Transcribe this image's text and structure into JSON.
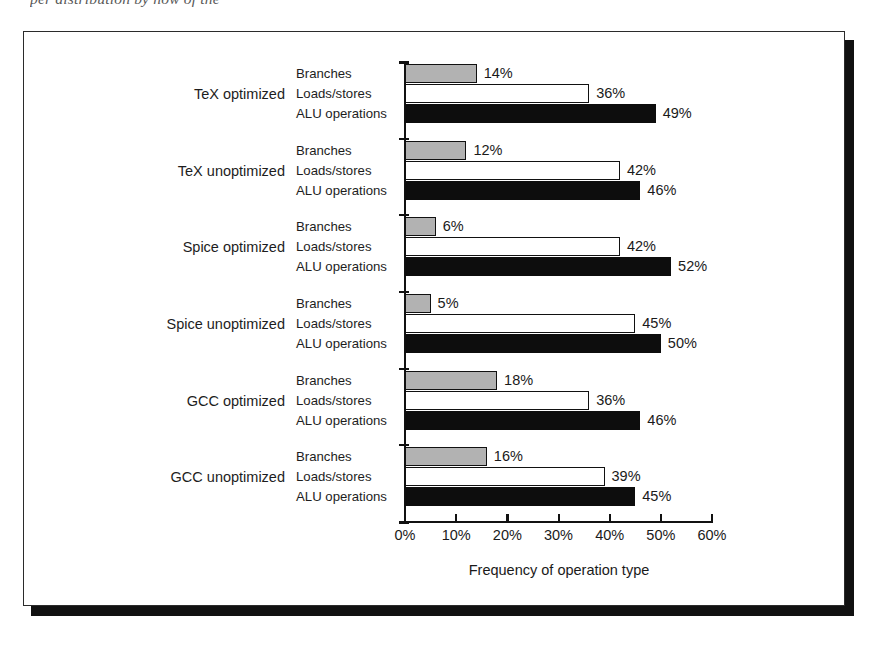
{
  "caption_fragment": "per distribution by now of the",
  "chart_data": {
    "type": "bar",
    "orientation": "horizontal",
    "title": "",
    "xlabel": "Frequency of operation type",
    "ylabel": "",
    "xlim": [
      0,
      60
    ],
    "xticks": [
      "0%",
      "10%",
      "20%",
      "30%",
      "40%",
      "50%",
      "60%"
    ],
    "xtick_values": [
      0,
      10,
      20,
      30,
      40,
      50,
      60
    ],
    "grid": false,
    "legend_position": "inline-row-labels",
    "series": [
      {
        "name": "Branches",
        "fill": "#b2b2b2",
        "values": [
          14,
          12,
          6,
          5,
          18,
          16
        ]
      },
      {
        "name": "Loads/stores",
        "fill": "#ffffff",
        "values": [
          36,
          42,
          42,
          45,
          36,
          39
        ]
      },
      {
        "name": "ALU operations",
        "fill": "#0d0d0d",
        "values": [
          49,
          46,
          52,
          50,
          46,
          45
        ]
      }
    ],
    "categories": [
      "TeX optimized",
      "TeX unoptimized",
      "Spice optimized",
      "Spice unoptimized",
      "GCC optimized",
      "GCC unoptimized"
    ],
    "groups": [
      {
        "label": "TeX optimized",
        "bars": [
          {
            "series": "Branches",
            "value": 14,
            "value_label": "14%"
          },
          {
            "series": "Loads/stores",
            "value": 36,
            "value_label": "36%"
          },
          {
            "series": "ALU operations",
            "value": 49,
            "value_label": "49%"
          }
        ]
      },
      {
        "label": "TeX unoptimized",
        "bars": [
          {
            "series": "Branches",
            "value": 12,
            "value_label": "12%"
          },
          {
            "series": "Loads/stores",
            "value": 42,
            "value_label": "42%"
          },
          {
            "series": "ALU operations",
            "value": 46,
            "value_label": "46%"
          }
        ]
      },
      {
        "label": "Spice optimized",
        "bars": [
          {
            "series": "Branches",
            "value": 6,
            "value_label": "6%"
          },
          {
            "series": "Loads/stores",
            "value": 42,
            "value_label": "42%"
          },
          {
            "series": "ALU operations",
            "value": 52,
            "value_label": "52%"
          }
        ]
      },
      {
        "label": "Spice unoptimized",
        "bars": [
          {
            "series": "Branches",
            "value": 5,
            "value_label": "5%"
          },
          {
            "series": "Loads/stores",
            "value": 45,
            "value_label": "45%"
          },
          {
            "series": "ALU operations",
            "value": 50,
            "value_label": "50%"
          }
        ]
      },
      {
        "label": "GCC optimized",
        "bars": [
          {
            "series": "Branches",
            "value": 18,
            "value_label": "18%"
          },
          {
            "series": "Loads/stores",
            "value": 36,
            "value_label": "36%"
          },
          {
            "series": "ALU operations",
            "value": 46,
            "value_label": "46%"
          }
        ]
      },
      {
        "label": "GCC unoptimized",
        "bars": [
          {
            "series": "Branches",
            "value": 16,
            "value_label": "16%"
          },
          {
            "series": "Loads/stores",
            "value": 39,
            "value_label": "39%"
          },
          {
            "series": "ALU operations",
            "value": 45,
            "value_label": "45%"
          }
        ]
      }
    ]
  },
  "colors": {
    "branches": "#b2b2b2",
    "loads_stores": "#ffffff",
    "alu_operations": "#0d0d0d",
    "axis": "#111111",
    "frame": "#2b2b2b",
    "shadow": "#111111"
  }
}
